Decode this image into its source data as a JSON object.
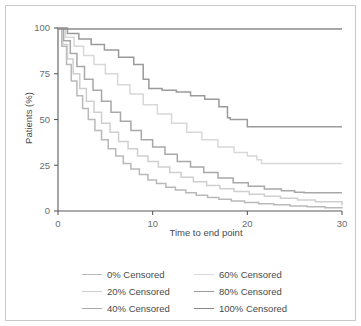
{
  "figure": {
    "background": "#ffffff",
    "border_color": "#c9c9c9"
  },
  "axis": {
    "y_title": "Patients (%)",
    "x_title": "Time to end point",
    "y_ticks": [
      "0",
      "25",
      "50",
      "75",
      "100"
    ],
    "x_ticks": [
      "0",
      "10",
      "20",
      "30"
    ],
    "axis_color": "#5a5a5a",
    "tick_label_color": "#6d6d6d"
  },
  "legend": {
    "entries": [
      {
        "label": "0% Censored",
        "color": "#b9b9b9"
      },
      {
        "label": "60% Censored",
        "color": "#d8d8d8"
      },
      {
        "label": "20% Censored",
        "color": "#cfcfcf"
      },
      {
        "label": "80% Censored",
        "color": "#9a9a9a"
      },
      {
        "label": "40% Censored",
        "color": "#a8a8a8"
      },
      {
        "label": "100% Censored",
        "color": "#8a8a8a"
      }
    ]
  },
  "chart_data": {
    "type": "line",
    "subtype": "kaplan-meier-step",
    "title": "",
    "xlabel": "Time to end point",
    "ylabel": "Patients (%)",
    "xlim": [
      0,
      30
    ],
    "ylim": [
      0,
      100
    ],
    "xticks": [
      0,
      10,
      20,
      30
    ],
    "yticks": [
      0,
      25,
      50,
      75,
      100
    ],
    "grid": false,
    "legend_position": "below-plot",
    "series": [
      {
        "name": "0% Censored",
        "color": "#b9b9b9",
        "x": [
          0,
          0.4,
          0.9,
          1.4,
          2.0,
          2.6,
          3.2,
          3.9,
          4.6,
          5.3,
          6.1,
          6.9,
          7.7,
          8.6,
          9.5,
          10.4,
          11.4,
          12.4,
          13.5,
          14.6,
          15.8,
          17.0,
          18.3,
          19.7,
          21.2,
          22.8,
          24.5,
          26.3,
          28.2,
          30
        ],
        "y": [
          100,
          90,
          80,
          71,
          63,
          56,
          50,
          44,
          39,
          34,
          30,
          26,
          23,
          20,
          17,
          15,
          13,
          11.5,
          10,
          8.6,
          7.4,
          6.4,
          5.5,
          4.7,
          4.0,
          3.4,
          2.8,
          2.3,
          1.8,
          1.4
        ]
      },
      {
        "name": "20% Censored",
        "color": "#cfcfcf",
        "x": [
          0,
          0.5,
          1.0,
          1.6,
          2.3,
          3.0,
          3.8,
          4.6,
          5.5,
          6.4,
          7.4,
          8.4,
          9.5,
          10.6,
          11.8,
          13.0,
          14.3,
          15.7,
          17.1,
          18.6,
          20.2,
          21.8,
          23.5,
          25.3,
          27.2,
          30
        ],
        "y": [
          100,
          91,
          83,
          75,
          67,
          60,
          54,
          48,
          43,
          38,
          34,
          30,
          27,
          24,
          21,
          18.5,
          16,
          14,
          12.2,
          10.6,
          9.2,
          8.0,
          7.0,
          6.0,
          5.0,
          3.0
        ]
      },
      {
        "name": "40% Censored",
        "color": "#a8a8a8",
        "x": [
          0,
          0.6,
          1.3,
          2.0,
          2.8,
          3.7,
          4.6,
          5.6,
          6.6,
          7.7,
          8.8,
          10.0,
          11.3,
          12.6,
          14.0,
          15.4,
          16.9,
          18.5,
          20.1,
          21.8,
          23.6,
          25.0,
          26.0,
          30
        ],
        "y": [
          100,
          93,
          86,
          79,
          72,
          66,
          60,
          54,
          49,
          44,
          39,
          35,
          31,
          27,
          24,
          21,
          18,
          15.5,
          13.5,
          12,
          11,
          10.2,
          10,
          10
        ]
      },
      {
        "name": "60% Censored",
        "color": "#d8d8d8",
        "x": [
          0,
          0.8,
          1.7,
          2.7,
          3.8,
          5.0,
          6.3,
          7.6,
          9.0,
          10.5,
          12.0,
          13.6,
          15.2,
          16.9,
          18.6,
          20.0,
          21.0,
          21.5,
          30
        ],
        "y": [
          100,
          95,
          90,
          85,
          80,
          75,
          69,
          64,
          58,
          53,
          48,
          43,
          39,
          35,
          32,
          30,
          28,
          26,
          26
        ]
      },
      {
        "name": "80% Censored",
        "color": "#9a9a9a",
        "x": [
          0,
          1.0,
          2.2,
          3.5,
          4.9,
          6.4,
          8.0,
          9.0,
          9.6,
          11.0,
          12.5,
          14.0,
          15.5,
          17.0,
          17.9,
          18.2,
          19.8,
          20.0,
          30
        ],
        "y": [
          100,
          97,
          94,
          91,
          88,
          84,
          80,
          72,
          67,
          66,
          65,
          63,
          61,
          57,
          51,
          50,
          50,
          46,
          46
        ]
      },
      {
        "name": "100% Censored",
        "color": "#8a8a8a",
        "x": [
          0,
          30
        ],
        "y": [
          99.5,
          99.5
        ]
      }
    ]
  }
}
